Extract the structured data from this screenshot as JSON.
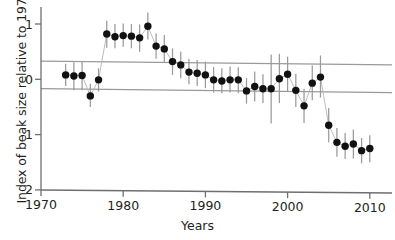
{
  "chart_data": {
    "type": "scatter",
    "title": "",
    "xlabel": "Years",
    "ylabel": "Index of beak size relative to 1973",
    "xlim": [
      1970,
      2011
    ],
    "ylim": [
      -2,
      1.35
    ],
    "xticks": [
      1970,
      1980,
      1990,
      2000,
      2010
    ],
    "xtick_labels": [
      "1970",
      "1980",
      "1990",
      "2000",
      "2010"
    ],
    "yticks": [
      1,
      0,
      -1,
      -2
    ],
    "ytick_labels": [
      "1",
      "0",
      "-1",
      "-2"
    ],
    "grid": false,
    "legend": null,
    "marker": "filled-circle",
    "series": [
      {
        "name": "Index of beak size relative to 1973",
        "x": [
          1973,
          1974,
          1975,
          1976,
          1977,
          1978,
          1979,
          1980,
          1981,
          1982,
          1983,
          1984,
          1985,
          1986,
          1987,
          1988,
          1989,
          1990,
          1991,
          1992,
          1993,
          1994,
          1995,
          1996,
          1997,
          1998,
          1999,
          2000,
          2001,
          2002,
          2003,
          2004,
          2005,
          2006,
          2007,
          2008,
          2009,
          2010
        ],
        "values": [
          0.08,
          0.06,
          0.07,
          -0.3,
          -0.01,
          0.82,
          0.77,
          0.79,
          0.78,
          0.75,
          0.96,
          0.6,
          0.55,
          0.32,
          0.26,
          0.13,
          0.11,
          0.08,
          -0.01,
          -0.03,
          -0.01,
          -0.01,
          -0.21,
          -0.13,
          -0.17,
          -0.17,
          0.01,
          0.09,
          -0.2,
          -0.48,
          -0.07,
          0.04,
          -0.83,
          -1.14,
          -1.21,
          -1.17,
          -1.29,
          -1.25
        ],
        "err_low": [
          -0.12,
          -0.2,
          -0.2,
          -0.5,
          -0.22,
          0.57,
          0.56,
          0.59,
          0.56,
          0.5,
          0.72,
          0.37,
          0.31,
          0.08,
          0.02,
          -0.09,
          -0.12,
          -0.16,
          -0.24,
          -0.25,
          -0.24,
          -0.25,
          -0.44,
          -0.4,
          -0.43,
          -0.8,
          -0.43,
          -0.23,
          -0.5,
          -0.79,
          -0.38,
          -0.33,
          -1.14,
          -1.4,
          -1.44,
          -1.43,
          -1.52,
          -1.5
        ],
        "err_high": [
          0.28,
          0.31,
          0.33,
          -0.08,
          0.2,
          1.06,
          1.0,
          1.01,
          1.0,
          0.99,
          1.21,
          0.83,
          0.8,
          0.56,
          0.5,
          0.37,
          0.35,
          0.32,
          0.22,
          0.2,
          0.23,
          0.22,
          0.02,
          0.14,
          0.09,
          0.45,
          0.46,
          0.41,
          0.1,
          -0.17,
          0.25,
          0.43,
          -0.52,
          -0.88,
          -0.97,
          -0.91,
          -1.06,
          -1.01
        ]
      }
    ],
    "reference_lines": [
      {
        "name": "upper-reference-line",
        "y_left": 0.33,
        "y_right": 0.26
      },
      {
        "name": "lower-reference-line",
        "y_left": -0.17,
        "y_right": -0.24
      }
    ]
  }
}
